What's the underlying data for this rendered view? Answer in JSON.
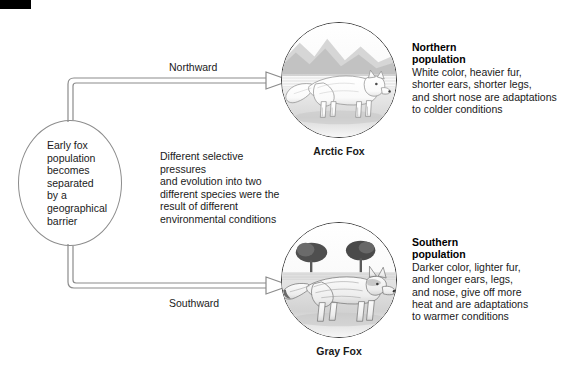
{
  "diagram": {
    "corner_marker": "black-bar",
    "line_color": "#8c8c8c",
    "text_color": "#1a1a1a",
    "circle_border_color": "#3a3a3a"
  },
  "origin_node": {
    "text": "Early fox\npopulation\nbecomes\nseparated\nby a\ngeographical\nbarrier"
  },
  "middle_note": {
    "text": "Different selective pressures\nand evolution into two\ndifferent species were the\nresult of different\nenvironmental conditions"
  },
  "arrows": {
    "north_label": "Northward",
    "south_label": "Southward"
  },
  "branches": [
    {
      "id": "northern",
      "caption": "Arctic Fox",
      "heading": "Northern\npopulation",
      "body": "White color, heavier fur,\nshorter ears, shorter legs,\nand short nose are adaptations\nto colder conditions",
      "illustration": "arctic-fox-illustration"
    },
    {
      "id": "southern",
      "caption": "Gray Fox",
      "heading": "Southern\npopulation",
      "body": "Darker color, lighter fur,\nand longer ears, legs,\nand nose, give off more\nheat and are adaptations\nto warmer conditions",
      "illustration": "gray-fox-illustration"
    }
  ]
}
